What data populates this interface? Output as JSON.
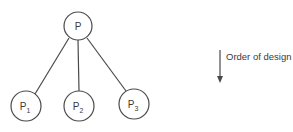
{
  "diagram": {
    "root": {
      "label": "P",
      "subscript": ""
    },
    "children": [
      {
        "label": "P",
        "subscript": "1"
      },
      {
        "label": "P",
        "subscript": "2"
      },
      {
        "label": "P",
        "subscript": "3"
      }
    ],
    "legend": {
      "text": "Order of design",
      "direction": "down"
    },
    "colors": {
      "stroke": "#4a4a4a",
      "text": "#3a3a3a",
      "background": "#ffffff"
    }
  }
}
